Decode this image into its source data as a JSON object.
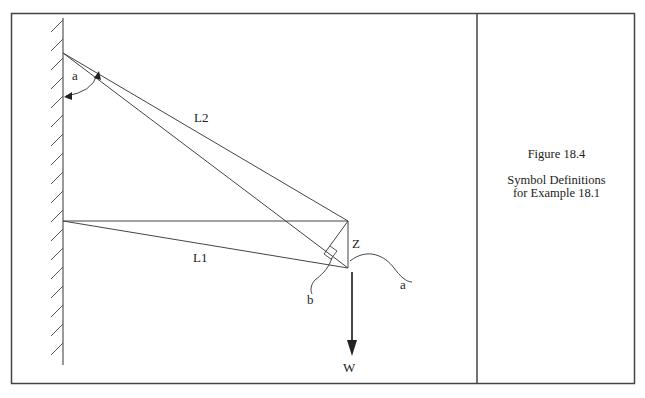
{
  "figure": {
    "number_label": "Figure 18.4",
    "description_line1": "Symbol Definitions",
    "description_line2": "for Example 18.1"
  },
  "diagram": {
    "labels": {
      "angle_a_top": "a",
      "cable_L2": "L2",
      "cable_L1": "L1",
      "displacement_Z": "Z",
      "angle_a_bottom": "a",
      "angle_b": "b",
      "weight_W": "W"
    },
    "colors": {
      "line": "#333333",
      "frame": "#444444",
      "background": "#ffffff"
    }
  }
}
